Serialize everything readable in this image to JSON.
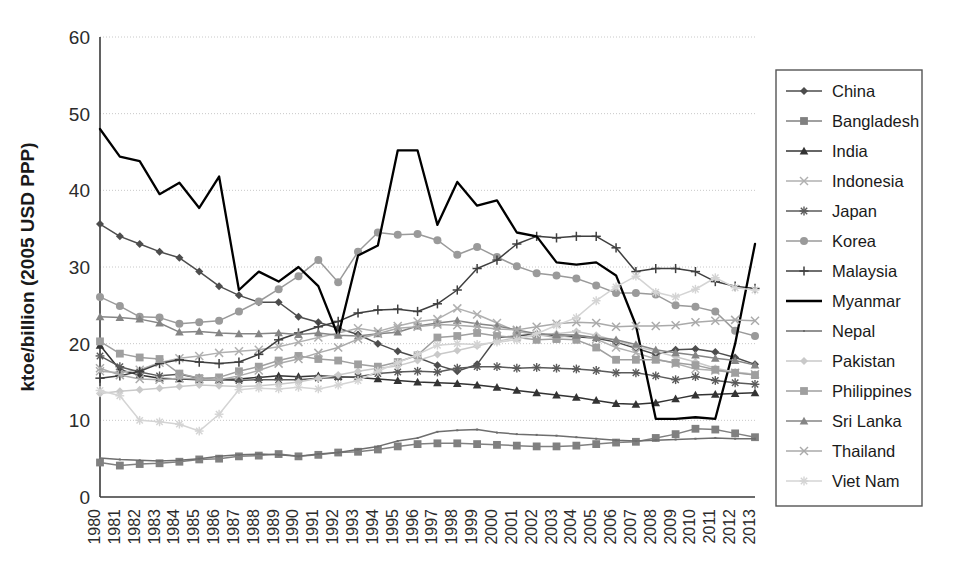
{
  "chart_data": {
    "type": "line",
    "title": "",
    "xlabel": "",
    "ylabel": "ktoe/billion (2005 USD PPP)",
    "ylim": [
      0,
      60
    ],
    "yticks": [
      0,
      10,
      20,
      30,
      40,
      50,
      60
    ],
    "grid": true,
    "legend_position": "right",
    "x": [
      "1980",
      "1981",
      "1982",
      "1983",
      "1984",
      "1985",
      "1986",
      "1987",
      "1988",
      "1989",
      "1990",
      "1991",
      "1992",
      "1993",
      "1994",
      "1995",
      "1996",
      "1997",
      "1998",
      "1999",
      "2000",
      "2001",
      "2002",
      "2003",
      "2004",
      "2005",
      "2006",
      "2007",
      "2008",
      "2009",
      "2010",
      "2011",
      "2012",
      "2013"
    ],
    "series": [
      {
        "name": "China",
        "marker": "diamond",
        "color": "#4d4d4d",
        "values": [
          35.6,
          34.0,
          33.0,
          32.0,
          31.2,
          29.4,
          27.5,
          26.3,
          25.4,
          25.4,
          23.5,
          22.8,
          22.0,
          21.2,
          20.0,
          19.0,
          18.2,
          17.2,
          16.4,
          17.3,
          20.8,
          21.0,
          21.3,
          21.0,
          20.9,
          20.7,
          20.2,
          19.4,
          18.6,
          19.2,
          19.3,
          18.9,
          18.2,
          17.3
        ]
      },
      {
        "name": "Bangladesh",
        "marker": "square",
        "color": "#808080",
        "values": [
          4.5,
          4.1,
          4.3,
          4.4,
          4.6,
          4.9,
          5.0,
          5.3,
          5.4,
          5.6,
          5.3,
          5.5,
          5.8,
          5.9,
          6.2,
          6.6,
          6.9,
          7.0,
          7.0,
          6.9,
          6.8,
          6.7,
          6.6,
          6.6,
          6.7,
          6.9,
          7.1,
          7.2,
          7.7,
          8.2,
          8.9,
          8.8,
          8.3,
          7.8
        ]
      },
      {
        "name": "India",
        "marker": "triangle",
        "color": "#333333",
        "values": [
          19.8,
          16.6,
          15.9,
          15.5,
          15.4,
          15.3,
          15.3,
          15.4,
          15.6,
          15.8,
          15.7,
          15.8,
          15.7,
          15.6,
          15.4,
          15.2,
          15.0,
          14.9,
          14.8,
          14.6,
          14.3,
          13.9,
          13.6,
          13.3,
          13.0,
          12.6,
          12.2,
          12.1,
          12.3,
          12.8,
          13.3,
          13.4,
          13.5,
          13.6
        ]
      },
      {
        "name": "Indonesia",
        "marker": "cross-x",
        "color": "#b0b0b0",
        "values": [
          16.4,
          16.2,
          16.6,
          17.5,
          18.1,
          18.4,
          18.8,
          19.0,
          19.2,
          19.6,
          20.2,
          20.8,
          21.4,
          22.0,
          21.6,
          22.3,
          22.9,
          23.2,
          24.6,
          23.8,
          22.7,
          21.6,
          21.2,
          20.8,
          21.2,
          20.6,
          19.5,
          18.8,
          18.0,
          17.4,
          16.7,
          16.5,
          16.2,
          16.0
        ]
      },
      {
        "name": "Japan",
        "marker": "star",
        "color": "#5a5a5a",
        "values": [
          18.4,
          17.0,
          16.3,
          15.8,
          16.0,
          15.5,
          15.3,
          15.2,
          15.3,
          15.3,
          15.3,
          15.5,
          15.6,
          15.7,
          16.1,
          16.3,
          16.4,
          16.3,
          16.8,
          17.0,
          17.0,
          16.8,
          16.9,
          16.8,
          16.7,
          16.5,
          16.2,
          16.2,
          15.8,
          15.3,
          15.7,
          15.2,
          14.9,
          14.7
        ]
      },
      {
        "name": "Korea",
        "marker": "circle",
        "color": "#9a9a9a",
        "values": [
          26.1,
          24.9,
          23.5,
          23.4,
          22.6,
          22.8,
          23.0,
          24.2,
          25.5,
          27.1,
          28.8,
          30.9,
          28.0,
          32.0,
          34.5,
          34.2,
          34.3,
          33.5,
          31.6,
          32.6,
          31.3,
          30.1,
          29.2,
          28.9,
          28.5,
          27.6,
          26.6,
          26.6,
          26.4,
          25.0,
          24.8,
          24.2,
          21.7,
          21.0
        ]
      },
      {
        "name": "Malaysia",
        "marker": "plus",
        "color": "#3f3f3f",
        "values": [
          15.5,
          15.8,
          16.4,
          17.4,
          17.9,
          17.6,
          17.4,
          17.6,
          18.6,
          20.5,
          21.4,
          22.2,
          22.9,
          24.0,
          24.4,
          24.5,
          24.2,
          25.2,
          27.0,
          29.8,
          30.9,
          33.0,
          34.0,
          33.8,
          34.0,
          34.0,
          32.5,
          29.4,
          29.8,
          29.8,
          29.4,
          28.1,
          27.5,
          27.2
        ]
      },
      {
        "name": "Myanmar",
        "marker": "none",
        "color": "#000000",
        "values": [
          48.0,
          44.4,
          43.8,
          39.5,
          41.0,
          37.7,
          41.8,
          27.0,
          29.4,
          28.1,
          30.0,
          27.5,
          21.0,
          31.5,
          32.8,
          45.2,
          45.2,
          35.5,
          41.1,
          38.0,
          38.7,
          34.5,
          34.0,
          30.6,
          30.3,
          30.6,
          28.9,
          22.4,
          10.2,
          10.2,
          10.4,
          10.2,
          20.0,
          33.0
        ]
      },
      {
        "name": "Nepal",
        "marker": "tiny-dot",
        "color": "#6e6e6e",
        "values": [
          5.1,
          4.9,
          4.8,
          4.7,
          4.8,
          5.0,
          5.3,
          5.5,
          5.6,
          5.5,
          5.3,
          5.6,
          5.8,
          6.2,
          6.6,
          7.3,
          7.7,
          8.5,
          8.7,
          8.8,
          8.4,
          8.2,
          8.1,
          8.0,
          7.8,
          7.6,
          7.4,
          7.3,
          7.4,
          7.5,
          7.6,
          7.7,
          7.6,
          7.6
        ]
      },
      {
        "name": "Pakistan",
        "marker": "diamond",
        "color": "#c9c9c9",
        "values": [
          13.5,
          13.8,
          14.0,
          14.2,
          14.4,
          14.6,
          14.5,
          14.4,
          14.5,
          14.7,
          15.0,
          15.5,
          15.9,
          16.4,
          16.8,
          17.1,
          17.8,
          18.6,
          19.1,
          19.7,
          20.3,
          20.8,
          21.0,
          21.3,
          21.6,
          21.1,
          20.4,
          19.6,
          19.0,
          18.3,
          17.6,
          16.8,
          16.3,
          16.0
        ]
      },
      {
        "name": "Philippines",
        "marker": "square",
        "color": "#9f9f9f",
        "values": [
          20.3,
          18.7,
          18.2,
          18.0,
          16.1,
          15.5,
          15.6,
          16.4,
          17.0,
          17.8,
          18.4,
          18.0,
          17.8,
          17.3,
          17.0,
          17.6,
          18.5,
          20.8,
          21.0,
          21.4,
          21.0,
          20.8,
          20.5,
          20.6,
          20.5,
          19.5,
          17.9,
          17.9,
          17.9,
          17.5,
          17.2,
          16.6,
          16.2,
          15.9
        ]
      },
      {
        "name": "Sri Lanka",
        "marker": "triangle",
        "color": "#858585",
        "values": [
          23.5,
          23.4,
          23.2,
          22.7,
          21.5,
          21.6,
          21.4,
          21.3,
          21.3,
          21.4,
          21.2,
          21.4,
          21.1,
          21.0,
          21.3,
          21.5,
          22.3,
          22.7,
          23.0,
          22.6,
          22.3,
          21.8,
          21.3,
          21.2,
          21.1,
          20.8,
          20.5,
          19.9,
          19.2,
          18.8,
          18.5,
          18.1,
          17.8,
          17.2
        ]
      },
      {
        "name": "Thailand",
        "marker": "cross-x",
        "color": "#aaaaaa",
        "values": [
          16.8,
          15.9,
          15.4,
          15.3,
          15.5,
          15.4,
          15.3,
          15.8,
          16.5,
          17.4,
          18.0,
          18.8,
          19.5,
          20.6,
          21.3,
          22.0,
          22.2,
          22.5,
          22.4,
          22.2,
          21.9,
          21.8,
          22.2,
          22.6,
          22.8,
          22.7,
          22.2,
          22.3,
          22.3,
          22.4,
          22.8,
          23.0,
          23.1,
          23.0
        ]
      },
      {
        "name": "Viet Nam",
        "marker": "star-light",
        "color": "#d4d4d4",
        "values": [
          13.9,
          13.2,
          10.0,
          9.8,
          9.5,
          8.6,
          10.8,
          14.0,
          14.2,
          14.1,
          14.3,
          14.1,
          14.6,
          15.2,
          16.4,
          17.5,
          18.6,
          19.8,
          20.0,
          19.9,
          20.2,
          20.5,
          21.3,
          22.4,
          23.4,
          25.6,
          27.4,
          28.8,
          26.7,
          26.1,
          27.1,
          28.6,
          27.3,
          27.0
        ]
      }
    ]
  },
  "legend": {
    "items": [
      {
        "label": "China"
      },
      {
        "label": "Bangladesh"
      },
      {
        "label": "India"
      },
      {
        "label": "Indonesia"
      },
      {
        "label": "Japan"
      },
      {
        "label": "Korea"
      },
      {
        "label": "Malaysia"
      },
      {
        "label": "Myanmar"
      },
      {
        "label": "Nepal"
      },
      {
        "label": "Pakistan"
      },
      {
        "label": "Philippines"
      },
      {
        "label": "Sri Lanka"
      },
      {
        "label": "Thailand"
      },
      {
        "label": "Viet Nam"
      }
    ]
  },
  "colors": {
    "axis": "#3a3a3a",
    "grid": "#c8c8c8",
    "legend_border": "#555555",
    "background": "#ffffff"
  }
}
